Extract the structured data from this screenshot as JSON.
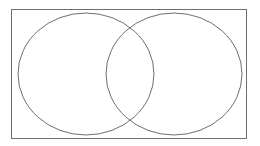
{
  "diagram": {
    "type": "venn",
    "sets": 2,
    "labels": [],
    "colors": {
      "background": "#ffffff",
      "frame_stroke": "#6e6e6e",
      "circle_stroke": "#6e6e6e"
    },
    "frame": {
      "x": 11.5,
      "y": 9.5,
      "width": 235,
      "height": 129
    },
    "circles": [
      {
        "name": "left",
        "cx": 86,
        "cy": 74,
        "rx": 68,
        "ry": 61
      },
      {
        "name": "right",
        "cx": 174,
        "cy": 74,
        "rx": 68,
        "ry": 61
      }
    ]
  }
}
